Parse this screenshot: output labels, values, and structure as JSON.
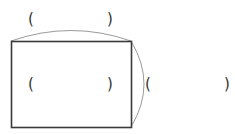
{
  "diagram": {
    "type": "rectangle-with-braces",
    "colors": {
      "rect_stroke": "#3a3a3a",
      "arc_stroke": "#9a9a9a",
      "text": "#333333",
      "background": "#ffffff"
    },
    "rectangle": {
      "x": 11,
      "y": 41,
      "width": 120,
      "height": 86
    },
    "top_brace": {
      "label": "",
      "open": "(",
      "close": ")"
    },
    "center_label": {
      "label": "",
      "open": "(",
      "close": ")"
    },
    "right_brace": {
      "label": "",
      "open": "(",
      "close": ")"
    }
  }
}
